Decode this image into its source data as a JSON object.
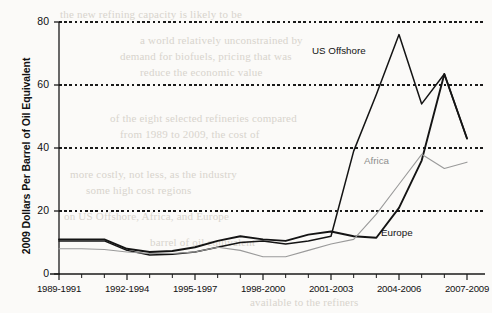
{
  "chart_data": {
    "type": "line",
    "title": "",
    "xlabel": "",
    "ylabel": "2009 Dollars Per Barrel of Oil Equivalent",
    "ylim": [
      0,
      80
    ],
    "yticks": [
      0,
      20,
      40,
      60,
      80
    ],
    "grid": "horizontal-dashed",
    "legend": "inline-labels",
    "categories": [
      "1989-1991",
      "1990-1992",
      "1991-1993",
      "1992-1994",
      "1993-1995",
      "1994-1996",
      "1995-1997",
      "1996-1998",
      "1997-1999",
      "1998-2000",
      "1999-2001",
      "2000-2002",
      "2001-2003",
      "2002-2004",
      "2003-2005",
      "2004-2006",
      "2005-2007",
      "2006-2008",
      "2007-2009"
    ],
    "labeled_categories": [
      "1989-1991",
      "1992-1994",
      "1995-1997",
      "1998-2000",
      "2001-2003",
      "2004-2006",
      "2007-2009"
    ],
    "series": [
      {
        "name": "US Offshore",
        "color": "#141414",
        "style": "solid",
        "values": [
          10.5,
          10.5,
          10.5,
          7.5,
          6.0,
          6.3,
          7.0,
          8.5,
          10.0,
          10.5,
          9.5,
          10.5,
          12.0,
          39.0,
          57.0,
          76.0,
          54.0,
          63.5,
          43.0
        ]
      },
      {
        "name": "Europe",
        "color": "#141414",
        "style": "solid",
        "values": [
          11.0,
          11.0,
          11.0,
          8.0,
          7.0,
          7.3,
          8.5,
          10.5,
          12.0,
          11.0,
          10.5,
          12.5,
          13.5,
          12.0,
          11.5,
          21.0,
          36.0,
          63.5,
          43.0
        ]
      },
      {
        "name": "Africa",
        "color": "#9a9a9a",
        "style": "solid-thin",
        "values": [
          8.0,
          8.0,
          7.8,
          7.0,
          6.5,
          6.5,
          7.0,
          8.5,
          7.5,
          5.5,
          5.5,
          7.5,
          9.5,
          11.0,
          19.0,
          28.5,
          38.0,
          33.5,
          35.5
        ]
      }
    ],
    "annotations": [
      {
        "text": "US Offshore",
        "series": "US Offshore",
        "color": "#141414"
      },
      {
        "text": "Africa",
        "series": "Africa",
        "color": "#8e8e8e"
      },
      {
        "text": "Europe",
        "series": "Europe",
        "color": "#141414"
      }
    ]
  },
  "page_bleed": {
    "lines": [
      "the new refining capacity is likely to be",
      "a world relatively unconstrained by",
      "demand for biofuels, pricing that was",
      "reduce the economic value",
      "of the eight selected refineries compared",
      "from 1989 to 2009, the cost of",
      "more costly, not less, as the industry",
      "some high cost regions",
      "on US Offshore, Africa, and Europe",
      "barrel of oil equivalent",
      "available to the refiners"
    ]
  }
}
